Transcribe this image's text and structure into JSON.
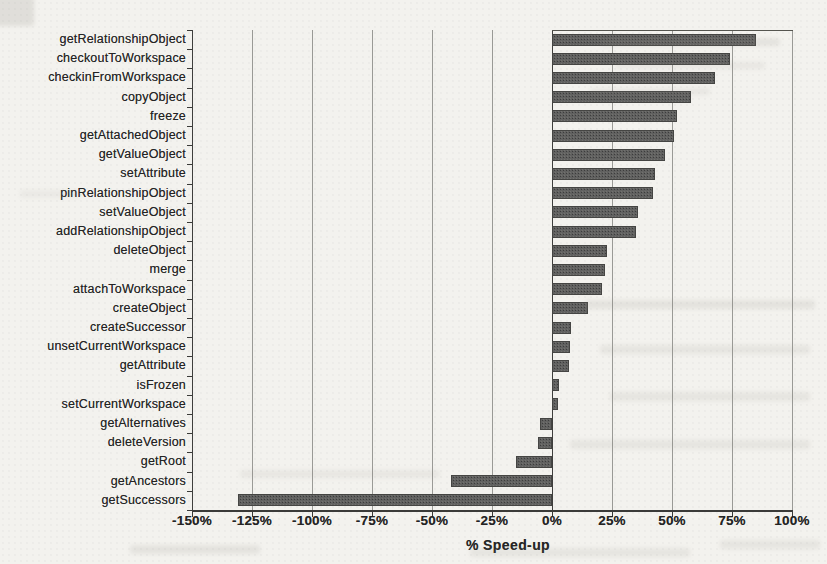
{
  "figure": {
    "background_color": "#f3f2ee",
    "bar_color": "#616160",
    "gridline_color": "#9a9a96",
    "axis_color": "#3a3a38",
    "text_color": "#242424"
  },
  "chart_data": {
    "type": "bar",
    "orientation": "horizontal",
    "title": "",
    "xlabel": "% Speed-up",
    "ylabel": "",
    "xlim": [
      -150,
      100
    ],
    "grid": true,
    "x_tick_labels": [
      "-150%",
      "-125%",
      "-100%",
      "-75%",
      "-50%",
      "-25%",
      "0%",
      "25%",
      "50%",
      "75%",
      "100%"
    ],
    "x_tick_values": [
      -150,
      -125,
      -100,
      -75,
      -50,
      -25,
      0,
      25,
      50,
      75,
      100
    ],
    "categories": [
      "getRelationshipObject",
      "checkoutToWorkspace",
      "checkinFromWorkspace",
      "copyObject",
      "freeze",
      "getAttachedObject",
      "getValueObject",
      "setAttribute",
      "pinRelationshipObject",
      "setValueObject",
      "addRelationshipObject",
      "deleteObject",
      "merge",
      "attachToWorkspace",
      "createObject",
      "createSuccessor",
      "unsetCurrentWorkspace",
      "getAttribute",
      "isFrozen",
      "setCurrentWorkspace",
      "getAlternatives",
      "deleteVersion",
      "getRoot",
      "getAncestors",
      "getSuccessors"
    ],
    "values": [
      85,
      74,
      68,
      58,
      52,
      51,
      47,
      43,
      42,
      36,
      35,
      23,
      22,
      21,
      15,
      8,
      7.5,
      7,
      3,
      2.5,
      -5,
      -6,
      -15,
      -42,
      -131
    ]
  }
}
